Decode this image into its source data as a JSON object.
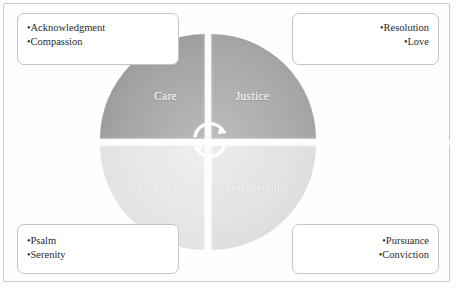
{
  "diagram": {
    "type": "quadrant-cycle",
    "title": "",
    "quadrants": [
      {
        "id": "care",
        "label": "Care",
        "position": "top-left",
        "fill": "#a5a5a5"
      },
      {
        "id": "justice",
        "label": "Justice",
        "position": "top-right",
        "fill": "#aaaaaa"
      },
      {
        "id": "conviction",
        "label": "Conviction",
        "position": "bottom-left",
        "fill": "#e6e6e6"
      },
      {
        "id": "responsibility",
        "label": "Responsibility",
        "position": "bottom-right",
        "fill": "#e2e2e2"
      }
    ],
    "center": {
      "icon": "cycle-arrows-icon",
      "description": "two curved arrows forming a clockwise cycle"
    },
    "callouts": [
      {
        "id": "top-left",
        "align": "left",
        "items": [
          "Acknowledgment",
          "Compassion"
        ]
      },
      {
        "id": "top-right",
        "align": "right",
        "items": [
          "Resolution",
          "Love"
        ]
      },
      {
        "id": "bottom-left",
        "align": "left",
        "items": [
          "Psalm",
          "Serenity"
        ]
      },
      {
        "id": "bottom-right",
        "align": "right",
        "items": [
          "Pursuance",
          "Conviction"
        ]
      }
    ],
    "bullet_char": "•",
    "colors": {
      "frame_border": "#c9c9c9",
      "callout_border": "#c4c4c4",
      "background": "#fdfdfd",
      "dark_quadrant": "#a5a5a5",
      "light_quadrant": "#e4e4e4",
      "label_text": "#ffffff",
      "callout_text": "#2b2b2b"
    }
  }
}
